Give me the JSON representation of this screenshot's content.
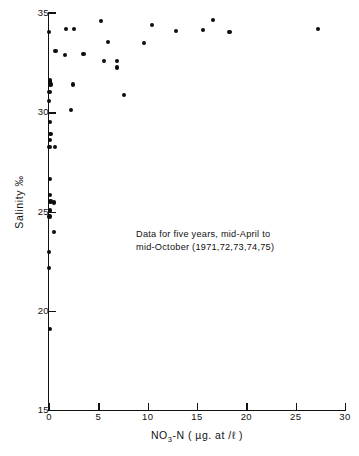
{
  "chart_data": {
    "type": "scatter",
    "title": "",
    "xlabel": "NO3-N ( µg. at / ℓ )",
    "xlabel_parts": {
      "prefix": "NO",
      "sub": "3",
      "suffix": "-N ( µg. at /ℓ )"
    },
    "ylabel": "Salinity  ‰",
    "xlim": [
      0,
      30
    ],
    "ylim": [
      15,
      35
    ],
    "xticks": [
      0,
      5,
      10,
      15,
      20,
      25,
      30
    ],
    "xtick_labels": [
      "0",
      "5",
      "10",
      "15",
      "20",
      "25",
      "30"
    ],
    "yticks": [
      15,
      20,
      25,
      30,
      35
    ],
    "ytick_labels": [
      "15",
      "20",
      "25",
      "30",
      "35"
    ],
    "grid": false,
    "legend": "none",
    "marker": "filled-circle",
    "marker_color": "#0d0d0d",
    "annotations": [
      "Data for five years, mid-April to",
      "mid-October (1971,72,73,74,75)"
    ],
    "points": [
      {
        "x": 0.0,
        "y": 34.05
      },
      {
        "x": 1.75,
        "y": 34.2
      },
      {
        "x": 2.5,
        "y": 34.2
      },
      {
        "x": 5.3,
        "y": 34.6
      },
      {
        "x": 10.4,
        "y": 34.4
      },
      {
        "x": 12.9,
        "y": 34.1
      },
      {
        "x": 15.6,
        "y": 34.15
      },
      {
        "x": 16.6,
        "y": 34.65
      },
      {
        "x": 18.3,
        "y": 34.05
      },
      {
        "x": 27.3,
        "y": 34.2
      },
      {
        "x": 6.0,
        "y": 33.55
      },
      {
        "x": 9.6,
        "y": 33.5
      },
      {
        "x": 0.65,
        "y": 33.1
      },
      {
        "x": 1.6,
        "y": 32.9
      },
      {
        "x": 3.5,
        "y": 32.95
      },
      {
        "x": 5.6,
        "y": 32.6
      },
      {
        "x": 6.9,
        "y": 32.6
      },
      {
        "x": 6.9,
        "y": 32.25
      },
      {
        "x": 0.1,
        "y": 31.6
      },
      {
        "x": 0.1,
        "y": 31.5
      },
      {
        "x": 0.15,
        "y": 31.4
      },
      {
        "x": 2.4,
        "y": 31.4
      },
      {
        "x": 0.05,
        "y": 31.0
      },
      {
        "x": 7.6,
        "y": 30.85
      },
      {
        "x": 0.0,
        "y": 30.55
      },
      {
        "x": 2.2,
        "y": 30.1
      },
      {
        "x": 0.1,
        "y": 29.5
      },
      {
        "x": 0.15,
        "y": 28.9
      },
      {
        "x": 0.1,
        "y": 28.6
      },
      {
        "x": 0.05,
        "y": 28.25
      },
      {
        "x": 0.6,
        "y": 28.25
      },
      {
        "x": 0.1,
        "y": 26.65
      },
      {
        "x": 0.1,
        "y": 25.85
      },
      {
        "x": 0.15,
        "y": 25.5
      },
      {
        "x": 0.5,
        "y": 25.45
      },
      {
        "x": 0.1,
        "y": 25.05
      },
      {
        "x": 0.05,
        "y": 24.75
      },
      {
        "x": 0.5,
        "y": 23.95
      },
      {
        "x": 0.0,
        "y": 22.95
      },
      {
        "x": 0.0,
        "y": 22.15
      },
      {
        "x": 0.1,
        "y": 19.1
      }
    ]
  }
}
